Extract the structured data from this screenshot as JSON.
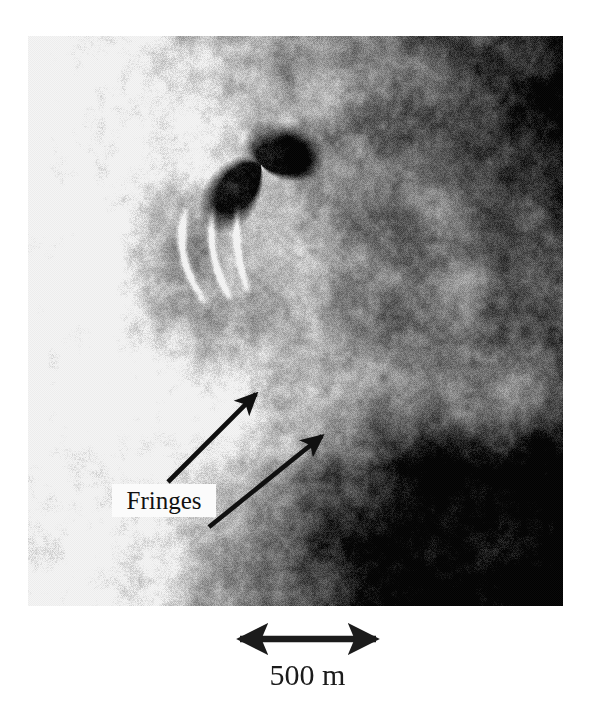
{
  "figure": {
    "type": "annotated-sar-image",
    "background_color": "#ffffff"
  },
  "sar_image": {
    "name": "radar-amplitude-image",
    "description": "Grainy grayscale synthetic aperture radar image showing a bright terrain area on the left and a very dark region on the right, with a dark wedge-shaped notch and bright linear streaks near the upper center.",
    "frame": {
      "x": 28,
      "y": 36,
      "width": 535,
      "height": 570
    },
    "tone_min_hex": "#0d0d0d",
    "tone_max_hex": "#f2f2f2"
  },
  "annotations": {
    "fringes_label": {
      "text": "Fringes",
      "box_color": "#fbfbfb",
      "text_color": "#111111"
    },
    "arrows": [
      {
        "name": "fringes-arrow-upper",
        "from": {
          "x": 168,
          "y": 482
        },
        "to": {
          "x": 260,
          "y": 390
        },
        "color": "#101010"
      },
      {
        "name": "fringes-arrow-lower",
        "from": {
          "x": 209,
          "y": 527
        },
        "to": {
          "x": 327,
          "y": 431
        },
        "color": "#101010"
      }
    ]
  },
  "scale_bar": {
    "label": "500 m",
    "color": "#1b1b1b",
    "left_x": 228,
    "right_x": 388,
    "y": 639
  },
  "icons": {
    "arrow_head": "arrowhead-icon",
    "double_arrow": "double-headed-arrow-icon"
  }
}
